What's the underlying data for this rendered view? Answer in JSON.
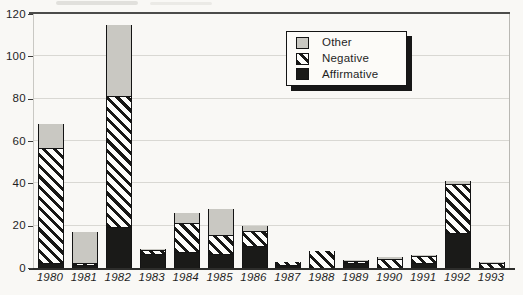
{
  "chart_data": {
    "type": "bar",
    "stacked": true,
    "title": "",
    "xlabel": "",
    "ylabel": "",
    "categories": [
      "1980",
      "1981",
      "1982",
      "1983",
      "1984",
      "1985",
      "1986",
      "1987",
      "1988",
      "1989",
      "1990",
      "1991",
      "1992",
      "1993"
    ],
    "series": [
      {
        "name": "Affirmative",
        "style": "affirmative",
        "color": "#1a1a18",
        "values": [
          2,
          1,
          19,
          6,
          7,
          6,
          10,
          1,
          0,
          2,
          0,
          2,
          16,
          0
        ]
      },
      {
        "name": "Negative",
        "style": "negative",
        "color": "hatch-diagonal",
        "values": [
          54,
          1,
          62,
          2,
          14,
          9,
          7,
          2,
          8,
          1,
          4,
          3,
          23,
          2
        ]
      },
      {
        "name": "Other",
        "style": "other",
        "color": "#c9c8c2",
        "values": [
          12,
          15,
          34,
          1,
          5,
          13,
          3,
          0,
          0,
          1,
          1,
          1,
          2,
          1
        ]
      }
    ],
    "ylim": [
      0,
      120
    ],
    "yticks": [
      0,
      20,
      40,
      60,
      80,
      100,
      120
    ],
    "grid": "horizontal-light",
    "legend_position": "inside-top-center"
  },
  "legend": {
    "items": [
      {
        "label": "Other",
        "style": "other"
      },
      {
        "label": "Negative",
        "style": "negative"
      },
      {
        "label": "Affirmative",
        "style": "affirmative"
      }
    ]
  },
  "colors": {
    "background": "#f9f8f5",
    "bar_black": "#1a1a18",
    "bar_gray": "#c9c8c2",
    "hatch_stripe": "#171715",
    "gridline": "#d9d8d3",
    "axis_line": "#2d2d2b",
    "text": "#1f1f1f"
  }
}
